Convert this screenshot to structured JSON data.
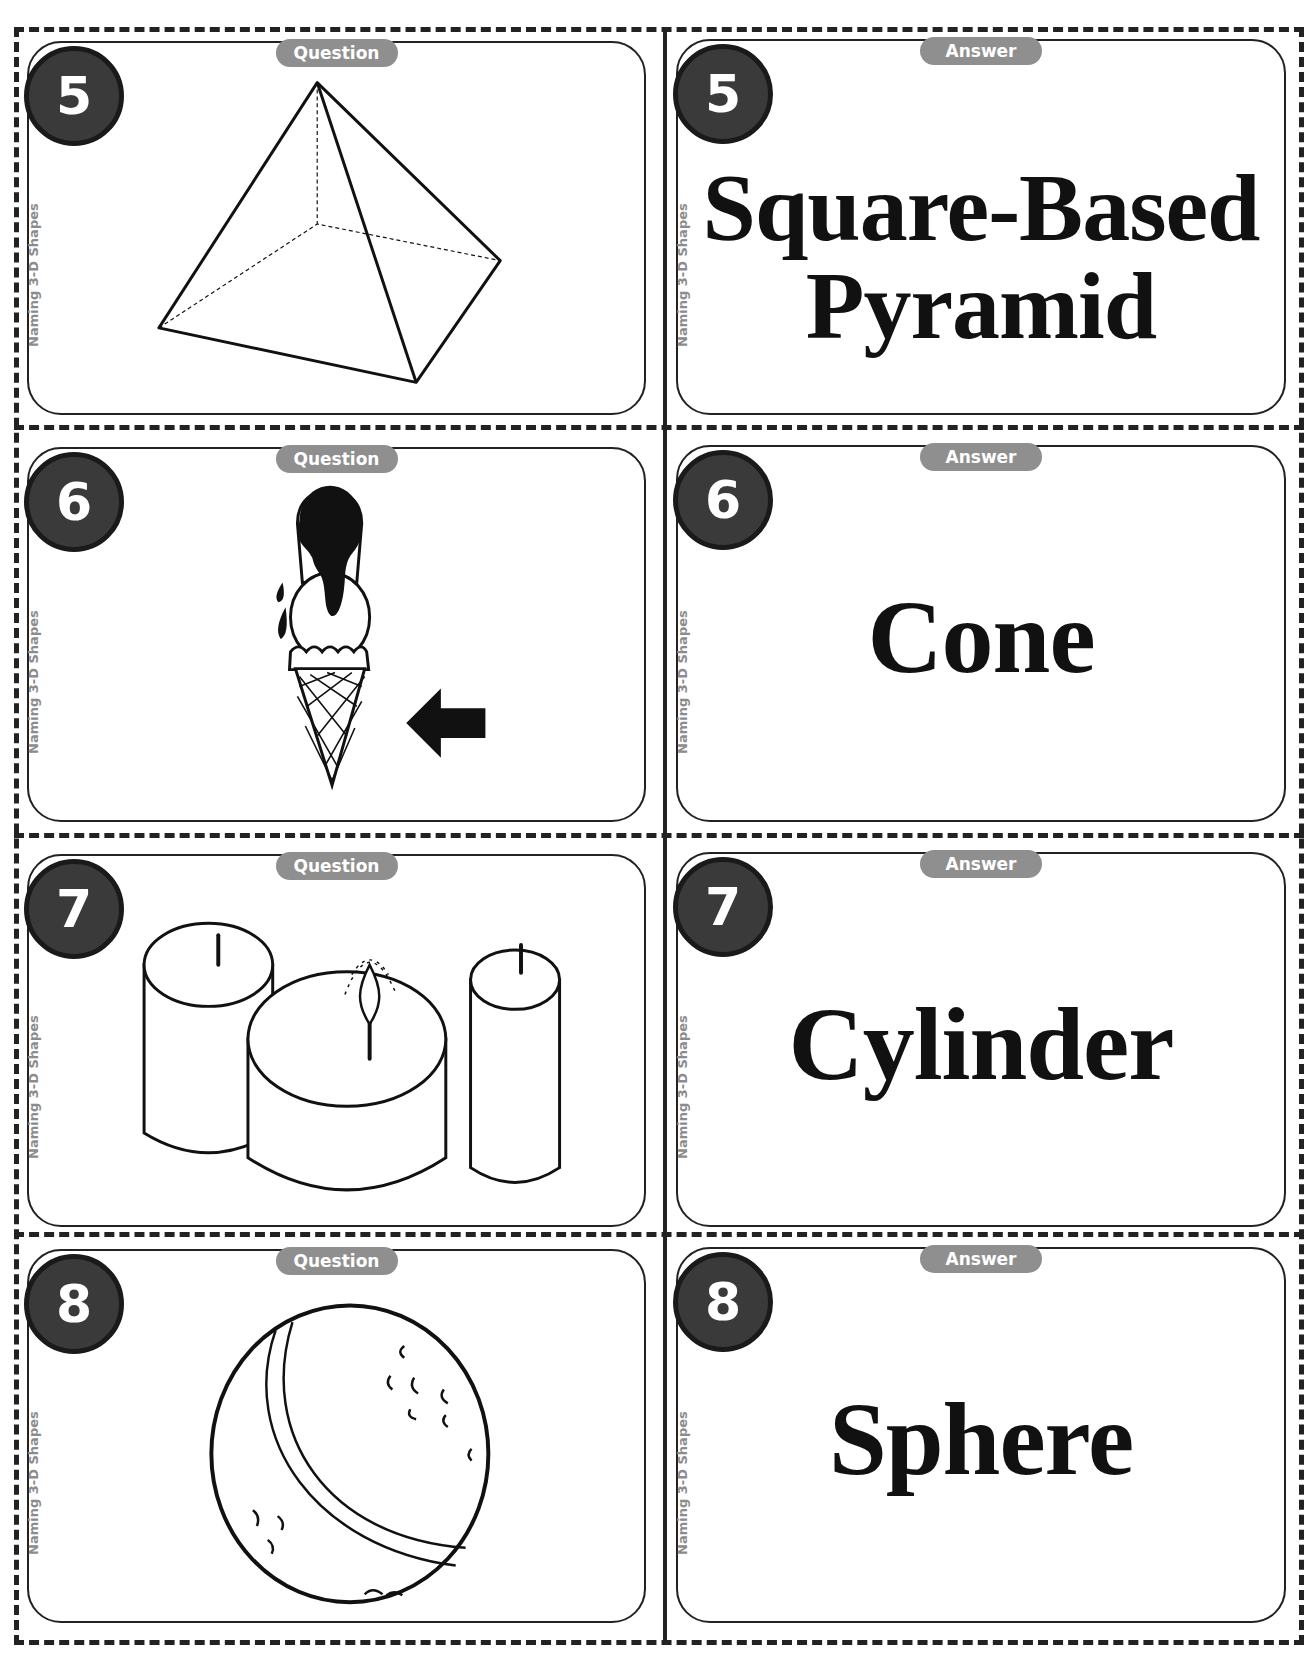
{
  "page": {
    "category_label": "Naming 3-D Shapes",
    "question_label": "Question",
    "answer_label": "Answer",
    "colors": {
      "badge_fill": "#3a3a3a",
      "badge_border": "#1a1a1a",
      "pill_fill": "#8f8f8f",
      "side_text": "#8c8c8c",
      "line": "#222222"
    }
  },
  "cards": [
    {
      "number": "5",
      "question_image": "square-based-pyramid-drawing",
      "answer_lines": [
        "Square-Based",
        "Pyramid"
      ]
    },
    {
      "number": "6",
      "question_image": "ice-cream-cone-with-arrow",
      "answer_lines": [
        "Cone"
      ]
    },
    {
      "number": "7",
      "question_image": "three-candles",
      "answer_lines": [
        "Cylinder"
      ]
    },
    {
      "number": "8",
      "question_image": "ball",
      "answer_lines": [
        "Sphere"
      ]
    }
  ]
}
